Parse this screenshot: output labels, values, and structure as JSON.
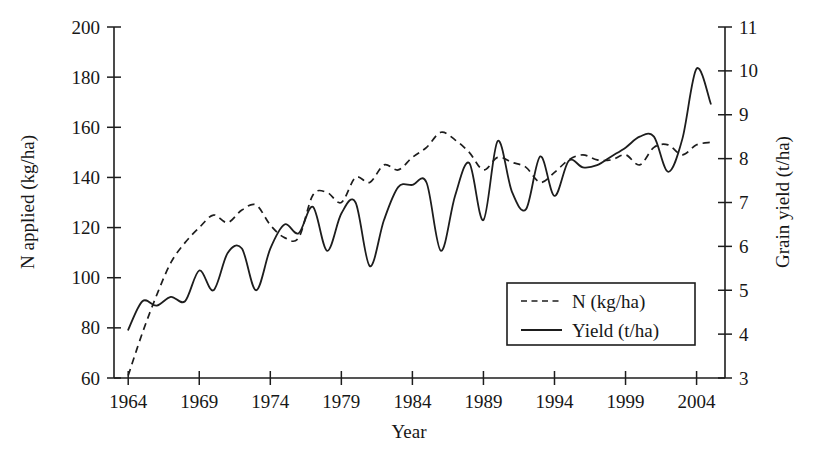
{
  "chart_data": {
    "type": "line",
    "title": "",
    "subtitle": "",
    "xlabel": "Year",
    "ylabel": "N applied (kg/ha)",
    "y2label": "Grain yield (t/ha)",
    "xlim": [
      1963.0,
      2006.0
    ],
    "ylim": [
      60,
      200
    ],
    "y2lim": [
      3,
      11
    ],
    "grid": false,
    "legend_position": "inside-lower-right",
    "xticks": [
      1964,
      1969,
      1974,
      1979,
      1984,
      1989,
      1994,
      1999,
      2004
    ],
    "xtick_labels": [
      "1964",
      "1969",
      "1974",
      "1979",
      "1984",
      "1989",
      "1994",
      "1999",
      "2004"
    ],
    "yticks": [
      60,
      80,
      100,
      120,
      140,
      160,
      180,
      200
    ],
    "ytick_labels": [
      "60",
      "80",
      "100",
      "120",
      "140",
      "160",
      "180",
      "200"
    ],
    "y2ticks": [
      3,
      4,
      5,
      6,
      7,
      8,
      9,
      10,
      11
    ],
    "y2tick_labels": [
      "3",
      "4",
      "5",
      "6",
      "7",
      "8",
      "9",
      "10",
      "11"
    ],
    "x": [
      1964,
      1965,
      1966,
      1967,
      1968,
      1969,
      1970,
      1971,
      1972,
      1973,
      1974,
      1975,
      1976,
      1977,
      1978,
      1979,
      1980,
      1981,
      1982,
      1983,
      1984,
      1985,
      1986,
      1987,
      1988,
      1989,
      1990,
      1991,
      1992,
      1993,
      1994,
      1995,
      1996,
      1997,
      1998,
      1999,
      2000,
      2001,
      2002,
      2003,
      2004,
      2005
    ],
    "series": [
      {
        "name": "N (kg/ha)",
        "axis": "left",
        "style": "dashed",
        "units": "kg/ha",
        "values": [
          61,
          78,
          93,
          106,
          114,
          120,
          125,
          122,
          127,
          129,
          121,
          116,
          116,
          133,
          134,
          130,
          140,
          138,
          145,
          143,
          148,
          152,
          158,
          155,
          150,
          143,
          148,
          146,
          144,
          138,
          142,
          147,
          149,
          147,
          147,
          149,
          145,
          152,
          153,
          149,
          153,
          154
        ]
      },
      {
        "name": "Yield (t/ha)",
        "axis": "right",
        "style": "solid",
        "units": "t/ha",
        "values": [
          4.1,
          4.75,
          4.65,
          4.85,
          4.75,
          5.45,
          5.0,
          5.85,
          5.95,
          5.0,
          5.95,
          6.5,
          6.3,
          6.9,
          5.9,
          6.75,
          7.0,
          5.55,
          6.6,
          7.35,
          7.4,
          7.45,
          5.9,
          7.15,
          7.9,
          6.6,
          8.4,
          7.25,
          6.85,
          8.05,
          7.15,
          7.95,
          7.8,
          7.85,
          8.05,
          8.25,
          8.5,
          8.5,
          7.7,
          8.45,
          10.05,
          9.25
        ]
      }
    ],
    "legend_entries": [
      {
        "label": "N (kg/ha)",
        "style": "dashed"
      },
      {
        "label": "Yield (t/ha)",
        "style": "solid"
      }
    ]
  }
}
